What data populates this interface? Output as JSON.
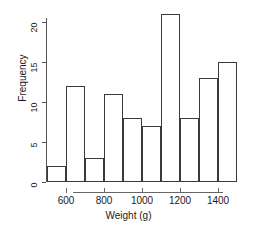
{
  "chart_data": {
    "type": "bar",
    "chart_style": "histogram",
    "title": "",
    "subtitle": "",
    "xlabel": "Weight (g)",
    "ylabel": "Frequency",
    "categories": [
      "500-600",
      "600-700",
      "700-800",
      "800-900",
      "900-1000",
      "1000-1100",
      "1100-1200",
      "1200-1300",
      "1300-1400",
      "1400-1500"
    ],
    "bin_edges": [
      500,
      600,
      700,
      800,
      900,
      1000,
      1100,
      1200,
      1300,
      1400,
      1500
    ],
    "bin_width": 100,
    "values": [
      2,
      12,
      3,
      11,
      8,
      7,
      21,
      8,
      13,
      15
    ],
    "xlim": [
      500,
      1500
    ],
    "ylim": [
      0,
      21
    ],
    "y_axis_max_tick": 20,
    "xticks": [
      600,
      800,
      1000,
      1200,
      1400
    ],
    "xtick_labels": [
      "600",
      "800",
      "1000",
      "1200",
      "1400"
    ],
    "yticks": [
      0,
      5,
      10,
      15,
      20
    ],
    "ytick_labels": [
      "0",
      "5",
      "10",
      "15",
      "20"
    ],
    "grid": false,
    "legend": false,
    "legend_position": "none",
    "bar_fill_color": "#ffffff",
    "bar_border_color": "#3a3a3a",
    "background_color": "#ffffff",
    "axis_color": "#555555",
    "total_count": 100
  }
}
